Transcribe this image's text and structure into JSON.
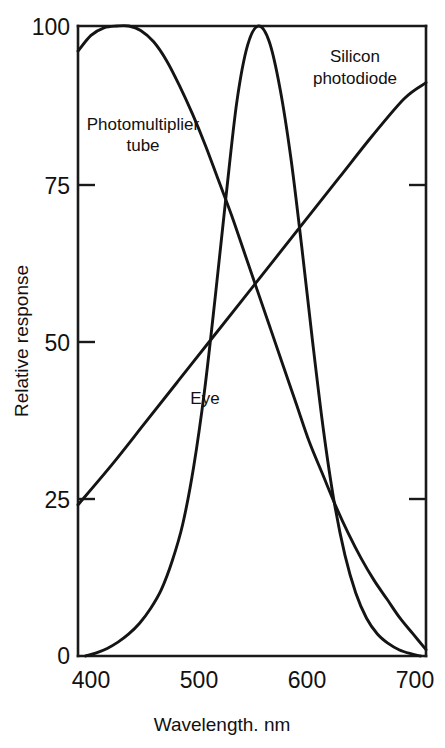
{
  "chart_data": {
    "type": "line",
    "title": "",
    "xlabel": "Wavelength. nm",
    "ylabel": "Relative response",
    "xlim": [
      388,
      710
    ],
    "ylim": [
      0,
      100
    ],
    "grid": false,
    "legend_position": "inline-annotations",
    "xticks": [
      400,
      500,
      600,
      700
    ],
    "yticks": [
      0,
      25,
      50,
      75,
      100
    ],
    "xtick_labels": [
      "400",
      "500",
      "600",
      "700"
    ],
    "ytick_labels": [
      "0",
      "25",
      "50",
      "75",
      "100"
    ],
    "series": [
      {
        "name": "Photomultiplier tube",
        "label_x": 400,
        "label_y": 86,
        "x": [
          388,
          400,
          412,
          424,
          435,
          446,
          458,
          470,
          482,
          494,
          506,
          518,
          530,
          542,
          554,
          566,
          578,
          590,
          602,
          614,
          626,
          638,
          650,
          662,
          674,
          686,
          698,
          710
        ],
        "y": [
          96,
          98.5,
          99.7,
          100,
          100,
          99.3,
          97.5,
          94.5,
          90.5,
          86,
          81,
          75.5,
          70,
          64,
          58,
          52,
          46,
          40,
          34,
          29,
          24,
          19.5,
          15.5,
          12,
          9,
          6,
          3.5,
          1
        ]
      },
      {
        "name": "Eye",
        "label_x": 497,
        "label_y": 41,
        "x": [
          395,
          405,
          415,
          425,
          435,
          445,
          455,
          465,
          475,
          485,
          495,
          505,
          515,
          525,
          535,
          545,
          555,
          565,
          575,
          585,
          595,
          605,
          615,
          625,
          635,
          645,
          655,
          665,
          675,
          685,
          695,
          705
        ],
        "y": [
          0,
          0.5,
          1.2,
          2.2,
          3.5,
          5.2,
          7.5,
          10.5,
          15,
          21,
          30,
          42,
          57,
          73,
          88,
          97,
          100,
          97.5,
          90,
          79,
          65,
          50,
          36,
          24.5,
          16,
          10,
          6,
          3.5,
          2,
          1,
          0.4,
          0
        ]
      },
      {
        "name": "Silicon photodiode",
        "label_x": 637,
        "label_y": 93,
        "x": [
          388,
          420,
          450,
          480,
          510,
          540,
          570,
          600,
          630,
          660,
          690,
          710
        ],
        "y": [
          24,
          30.5,
          37,
          43.5,
          50,
          56.5,
          63,
          69.5,
          76,
          82.5,
          88.5,
          91
        ]
      }
    ]
  },
  "labels": {
    "photomultiplier_line1": "Photomultiplier",
    "photomultiplier_line2": "tube",
    "eye": "Eye",
    "silicon_line1": "Silicon",
    "silicon_line2": "photodiode"
  },
  "colors": {
    "curve": "#141414",
    "axis": "#1a1a1a",
    "text": "#111111",
    "background": "#ffffff"
  }
}
